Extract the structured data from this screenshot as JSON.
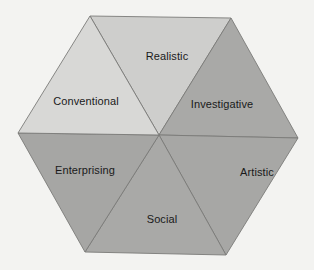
{
  "diagram": {
    "type": "hexagon",
    "background": "#f3f3f1",
    "center": [
      159,
      135
    ],
    "segments": [
      {
        "id": "realistic",
        "label": "Realistic",
        "fill": "#cececc",
        "points": [
          [
            90,
            16
          ],
          [
            231,
            18
          ],
          [
            159,
            135
          ]
        ],
        "label_pos": [
          167,
          56
        ]
      },
      {
        "id": "investigative",
        "label": "Investigative",
        "fill": "#a9a9a7",
        "points": [
          [
            231,
            18
          ],
          [
            298,
            138
          ],
          [
            159,
            135
          ]
        ],
        "label_pos": [
          222,
          104
        ]
      },
      {
        "id": "artistic",
        "label": "Artistic",
        "fill": "#a7a7a5",
        "points": [
          [
            298,
            138
          ],
          [
            226,
            255
          ],
          [
            159,
            135
          ]
        ],
        "label_pos": [
          257,
          172
        ]
      },
      {
        "id": "social",
        "label": "Social",
        "fill": "#a9a9a7",
        "points": [
          [
            226,
            255
          ],
          [
            85,
            252
          ],
          [
            159,
            135
          ]
        ],
        "label_pos": [
          162,
          219
        ]
      },
      {
        "id": "enterprising",
        "label": "Enterprising",
        "fill": "#a6a6a4",
        "points": [
          [
            85,
            252
          ],
          [
            18,
            133
          ],
          [
            159,
            135
          ]
        ],
        "label_pos": [
          85,
          170
        ]
      },
      {
        "id": "conventional",
        "label": "Conventional",
        "fill": "#d8d8d6",
        "points": [
          [
            18,
            133
          ],
          [
            90,
            16
          ],
          [
            159,
            135
          ]
        ],
        "label_pos": [
          86,
          101
        ]
      }
    ]
  },
  "labels": {
    "realistic": "Realistic",
    "investigative": "Investigative",
    "artistic": "Artistic",
    "social": "Social",
    "enterprising": "Enterprising",
    "conventional": "Conventional"
  }
}
